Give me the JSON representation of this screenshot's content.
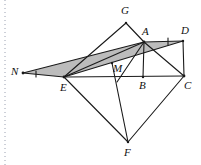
{
  "figure": {
    "type": "euclidean-plane-diagram",
    "canvas": {
      "width": 201,
      "height": 165
    },
    "colors": {
      "background": "#ffffff",
      "stroke": "#1a1a1a",
      "shade_fill": "#b8b8b8",
      "margin_rule": "#9aa0b0",
      "label": "#111111"
    },
    "points": [
      {
        "name": "N",
        "label": "N",
        "x": 23,
        "y": 73,
        "label_x": 11,
        "label_y": 66
      },
      {
        "name": "E",
        "label": "E",
        "x": 64,
        "y": 77,
        "label_x": 60,
        "label_y": 82
      },
      {
        "name": "G",
        "label": "G",
        "x": 126,
        "y": 23,
        "label_x": 121,
        "label_y": 5
      },
      {
        "name": "M",
        "label": "M",
        "x": 112,
        "y": 63,
        "label_x": 113,
        "label_y": 63
      },
      {
        "name": "A",
        "label": "A",
        "x": 144,
        "y": 42,
        "label_x": 142,
        "label_y": 26
      },
      {
        "name": "D",
        "label": "D",
        "x": 183,
        "y": 41,
        "label_x": 181,
        "label_y": 25
      },
      {
        "name": "B",
        "label": "B",
        "x": 143,
        "y": 77,
        "label_x": 139,
        "label_y": 80
      },
      {
        "name": "C",
        "label": "C",
        "x": 184,
        "y": 76,
        "label_x": 184,
        "label_y": 80
      },
      {
        "name": "F",
        "label": "F",
        "x": 128,
        "y": 142,
        "label_x": 124,
        "label_y": 147
      }
    ],
    "segments": [
      {
        "name": "segment-N-E",
        "from": "N",
        "to": "E"
      },
      {
        "name": "segment-N-A",
        "from": "N",
        "to": "A"
      },
      {
        "name": "segment-E-A",
        "from": "E",
        "to": "A"
      },
      {
        "name": "segment-E-D",
        "from": "E",
        "to": "D"
      },
      {
        "name": "segment-E-G",
        "from": "E",
        "to": "G"
      },
      {
        "name": "segment-G-A",
        "from": "G",
        "to": "A"
      },
      {
        "name": "segment-A-D",
        "from": "A",
        "to": "D"
      },
      {
        "name": "segment-A-B",
        "from": "A",
        "to": "B"
      },
      {
        "name": "segment-A-C",
        "from": "A",
        "to": "C"
      },
      {
        "name": "segment-D-C",
        "from": "D",
        "to": "C"
      },
      {
        "name": "segment-E-C",
        "from": "E",
        "to": "C"
      },
      {
        "name": "segment-E-F",
        "from": "E",
        "to": "F"
      },
      {
        "name": "segment-C-F",
        "from": "C",
        "to": "F"
      },
      {
        "name": "segment-M-F",
        "from": "M",
        "to": "F"
      },
      {
        "name": "segment-A-F",
        "from": "A",
        "to": "F"
      }
    ],
    "shaded_regions": [
      {
        "name": "shaded-triangle-N-E-A",
        "vertices": [
          "N",
          "E",
          "A"
        ]
      },
      {
        "name": "shaded-triangle-A-D-E",
        "vertices": [
          "A",
          "D",
          "E"
        ]
      }
    ],
    "tick_marks": [
      {
        "name": "tick-on-segment-A-D",
        "segment": "segment-A-D",
        "position": 0.62,
        "count": 1
      },
      {
        "name": "tick-on-segment-N-E",
        "segment": "segment-N-E",
        "position": 0.3,
        "count": 1
      }
    ],
    "margin_rule": {
      "name": "page-margin-dotted-rule",
      "x": 5,
      "y_top": 0,
      "y_bottom": 165,
      "dash": "1,3"
    }
  }
}
